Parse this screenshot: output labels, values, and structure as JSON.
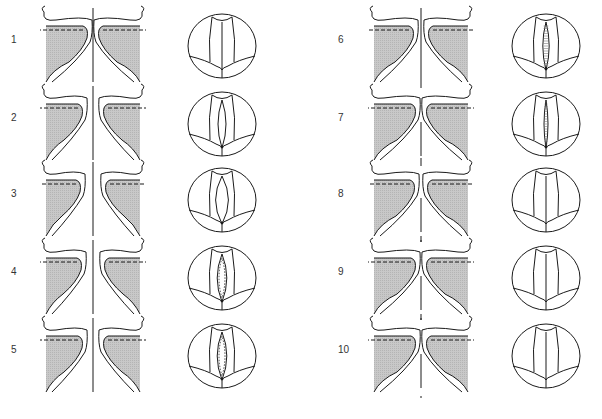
{
  "figure": {
    "colors": {
      "stroke": "#1a1a1a",
      "shade": "#c8c8c8",
      "background": "#ffffff"
    },
    "panels": [
      {
        "label": "1",
        "col": 0,
        "row": 0,
        "fold_gap": 0,
        "fold_contact": "apex",
        "glottis": "closed",
        "midline": "full"
      },
      {
        "label": "2",
        "col": 0,
        "row": 1,
        "fold_gap": 10,
        "fold_contact": "open",
        "glottis": "open-lens",
        "midline": "full"
      },
      {
        "label": "3",
        "col": 0,
        "row": 2,
        "fold_gap": 14,
        "fold_contact": "open",
        "glottis": "open-wide",
        "midline": "full"
      },
      {
        "label": "4",
        "col": 0,
        "row": 3,
        "fold_gap": 12,
        "fold_contact": "open",
        "glottis": "open-dashed",
        "midline": "full"
      },
      {
        "label": "5",
        "col": 0,
        "row": 4,
        "fold_gap": 10,
        "fold_contact": "open",
        "glottis": "open-dashed",
        "midline": "full"
      },
      {
        "label": "6",
        "col": 1,
        "row": 0,
        "fold_gap": 4,
        "fold_contact": "lower",
        "glottis": "narrow-hatched",
        "midline": "full"
      },
      {
        "label": "7",
        "col": 1,
        "row": 1,
        "fold_gap": 0,
        "fold_contact": "middle",
        "glottis": "slit-hatched",
        "midline": "dashed"
      },
      {
        "label": "8",
        "col": 1,
        "row": 2,
        "fold_gap": 2,
        "fold_contact": "upper",
        "glottis": "closed",
        "midline": "dashed"
      },
      {
        "label": "9",
        "col": 1,
        "row": 3,
        "fold_gap": 0,
        "fold_contact": "upper",
        "glottis": "closed",
        "midline": "dashed"
      },
      {
        "label": "10",
        "col": 1,
        "row": 4,
        "fold_gap": 0,
        "fold_contact": "apex",
        "glottis": "closed",
        "midline": "dashed"
      }
    ]
  }
}
